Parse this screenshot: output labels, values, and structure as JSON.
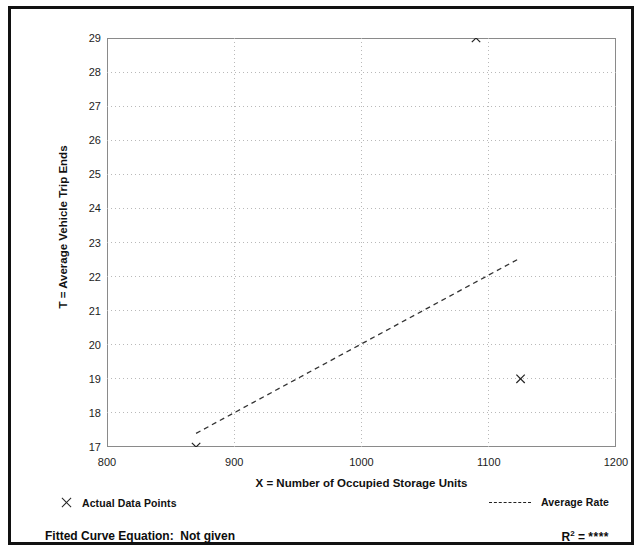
{
  "figure": {
    "y_axis_title": "T = Average Vehicle Trip Ends",
    "x_axis_title": "X = Number of Occupied Storage Units"
  },
  "legend": {
    "data_points_label": "Actual Data Points",
    "data_points_marker": "x-cross-marker",
    "average_rate_label": "Average Rate",
    "average_rate_marker": "dashed-line-swatch"
  },
  "footer": {
    "fitted_curve_label": "Fitted Curve Equation:  Not given",
    "r_squared_prefix": "R",
    "r_squared_exponent": "2",
    "r_squared_equals": " = ",
    "r_squared_value": "****"
  },
  "chart_data": {
    "type": "scatter",
    "title": "",
    "xlabel": "X = Number of Occupied Storage Units",
    "ylabel": "T = Average Vehicle Trip Ends",
    "xlim": [
      800,
      1200
    ],
    "ylim": [
      17,
      29
    ],
    "x_ticks": [
      800,
      900,
      1000,
      1100,
      1200
    ],
    "x_minor_tick_step": 50,
    "y_ticks": [
      17,
      18,
      19,
      20,
      21,
      22,
      23,
      24,
      25,
      26,
      27,
      28,
      29
    ],
    "y_minor_tick_step": 0.5,
    "grid": "dotted-light",
    "grid_x_values": [
      900,
      1000,
      1100
    ],
    "grid_y_values": [
      18,
      19,
      20,
      21,
      22,
      23,
      24,
      25,
      26,
      27,
      28
    ],
    "legend_position": "below-plot",
    "series": [
      {
        "name": "Actual Data Points",
        "type": "scatter",
        "marker": "x",
        "color": "#222222",
        "points": [
          {
            "x": 870,
            "y": 17.0
          },
          {
            "x": 1090,
            "y": 29.0
          },
          {
            "x": 1125,
            "y": 19.0
          }
        ]
      },
      {
        "name": "Average Rate",
        "type": "line",
        "style": "dashed",
        "color": "#333333",
        "x": [
          870,
          1125
        ],
        "y": [
          17.4,
          22.55
        ]
      }
    ]
  }
}
